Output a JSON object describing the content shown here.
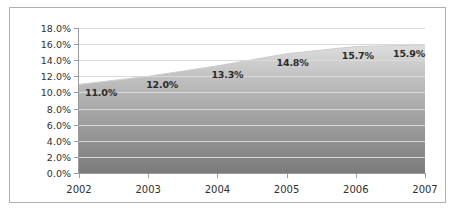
{
  "chart_data": {
    "type": "area",
    "title": "",
    "subtitle": "",
    "xlabel": "",
    "ylabel": "",
    "categories": [
      "2002",
      "2003",
      "2004",
      "2005",
      "2006",
      "2007"
    ],
    "x": [
      2002,
      2003,
      2004,
      2005,
      2006,
      2007
    ],
    "values": [
      11.0,
      12.0,
      13.3,
      14.8,
      15.7,
      15.9
    ],
    "data_labels": [
      "11.0%",
      "12.0%",
      "13.3%",
      "14.8%",
      "15.7%",
      "15.9%"
    ],
    "ylim": [
      0.0,
      18.0
    ],
    "ytick_values": [
      0.0,
      2.0,
      4.0,
      6.0,
      8.0,
      10.0,
      12.0,
      14.0,
      16.0,
      18.0
    ],
    "ytick_labels": [
      "0.0%",
      "2.0%",
      "4.0%",
      "6.0%",
      "8.0%",
      "10.0%",
      "12.0%",
      "14.0%",
      "16.0%",
      "18.0%"
    ],
    "xtick_labels": [
      "2002",
      "2003",
      "2004",
      "2005",
      "2006",
      "2007"
    ],
    "grid": "horizontal",
    "legend": "none",
    "series": [
      {
        "name": "",
        "values": [
          11.0,
          12.0,
          13.3,
          14.8,
          15.7,
          15.9
        ]
      }
    ],
    "colors": {
      "fill_top": "#dcdcdc",
      "fill_bottom": "#7d7d7d",
      "line": "#c9c9c9",
      "gridline": "#d9d9d9",
      "axis": "#9a9a9a",
      "text": "#2f2f2f",
      "label_text": "#2b2b2b",
      "border": "#b0b0b0",
      "background": "#ffffff"
    }
  }
}
